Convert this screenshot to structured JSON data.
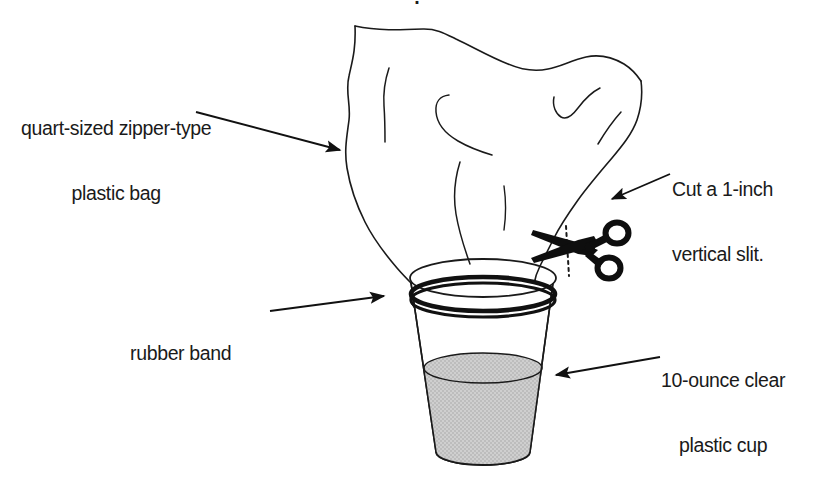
{
  "figure": {
    "type": "instructional-diagram",
    "background_color": "#ffffff",
    "ink_color": "#1a1a1a",
    "water_fill_color": "#c9c9c9",
    "clipped_heading": "."
  },
  "labels": {
    "bag": {
      "line_1": "quart-sized zipper-type",
      "line_2": "plastic bag"
    },
    "slit": {
      "line_1": "Cut a 1-inch",
      "line_2": "vertical slit."
    },
    "rubber_band": {
      "line_1": "rubber band"
    },
    "cup": {
      "line_1": "10-ounce clear",
      "line_2": "plastic cup"
    }
  },
  "callouts": [
    {
      "name": "bag-callout",
      "target": "plastic bag",
      "direction": "down-right"
    },
    {
      "name": "slit-callout",
      "target": "vertical slit near scissors",
      "direction": "down-left"
    },
    {
      "name": "rubber-band-callout",
      "target": "rubber band around cup rim",
      "direction": "right"
    },
    {
      "name": "cup-callout",
      "target": "plastic cup with water",
      "direction": "left"
    }
  ],
  "parts": [
    {
      "name": "plastic-bag",
      "description": "crinkled quart-sized zipper bag draped over the cup"
    },
    {
      "name": "rubber-band",
      "description": "thick black band securing the bag to the cup rim"
    },
    {
      "name": "plastic-cup",
      "description": "tapered clear 10-ounce cup"
    },
    {
      "name": "water",
      "description": "gray shaded water filling the lower half of the cup"
    },
    {
      "name": "scissors",
      "description": "black scissors cutting a vertical slit in the bag"
    },
    {
      "name": "slit",
      "description": "dotted vertical cut line on the bag near the scissors"
    }
  ]
}
